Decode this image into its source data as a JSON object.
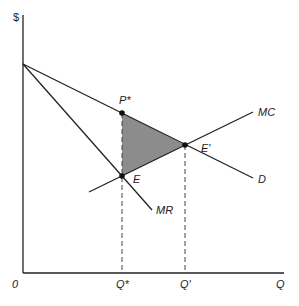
{
  "diagram": {
    "type": "monopoly deadweight loss",
    "axes": {
      "y_label": "$",
      "x_label": "Q",
      "origin": "0"
    },
    "curves": [
      {
        "name": "D",
        "label": "D"
      },
      {
        "name": "MR",
        "label": "MR"
      },
      {
        "name": "MC",
        "label": "MC"
      }
    ],
    "points": {
      "p_star": "P*",
      "e": "E",
      "e_prime": "E'"
    },
    "x_ticks": [
      "Q*",
      "Q'"
    ],
    "shaded_region": {
      "description": "deadweight loss triangle",
      "color": "#8c8c8c"
    }
  }
}
